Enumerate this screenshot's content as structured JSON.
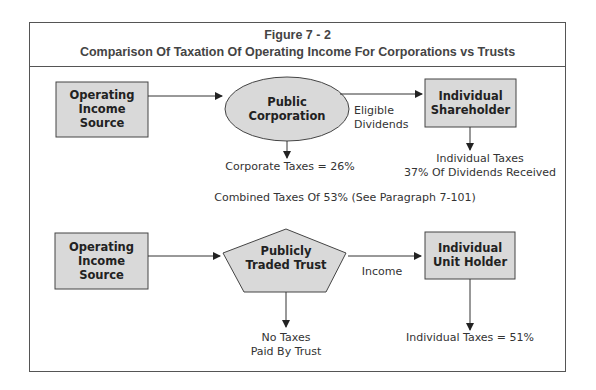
{
  "figure": {
    "number": "Figure 7 - 2",
    "title": "Comparison Of Taxation Of Operating Income For Corporations vs Trusts"
  },
  "colors": {
    "box_fill": "#d9d9d9",
    "stroke": "#444444",
    "frame": "#555555"
  },
  "corporation_flow": {
    "source": "Operating Income Source",
    "source_lines": [
      "Operating",
      "Income",
      "Source"
    ],
    "entity": "Public Corporation",
    "entity_lines": [
      "Public",
      "Corporation"
    ],
    "edge_label_lines": [
      "Eligible",
      "Dividends"
    ],
    "recipient_lines": [
      "Individual",
      "Shareholder"
    ],
    "entity_tax": "Corporate Taxes = 26%",
    "recipient_tax_lines": [
      "Individual Taxes",
      "37% Of Dividends Received"
    ]
  },
  "combined_note": "Combined Taxes Of 53% (See Paragraph 7-101)",
  "trust_flow": {
    "source_lines": [
      "Operating",
      "Income",
      "Source"
    ],
    "entity_lines": [
      "Publicly",
      "Traded Trust"
    ],
    "edge_label": "Income",
    "recipient_lines": [
      "Individual",
      "Unit Holder"
    ],
    "entity_tax_lines": [
      "No Taxes",
      "Paid By Trust"
    ],
    "recipient_tax": "Individual Taxes = 51%"
  }
}
